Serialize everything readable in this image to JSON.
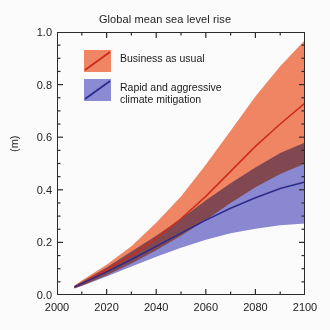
{
  "figure": {
    "title": "Global mean sea level rise",
    "background_color": "#fbfbfb",
    "axis_color": "#2b2b2b"
  },
  "legend": {
    "position": "top-left-inside",
    "entries": [
      {
        "label": "Business as usual",
        "band_color": "#ef8562",
        "line_color": "#cc2b1a",
        "swatch_name": "legend-swatch-business-as-usual"
      },
      {
        "label": "Rapid and aggressive\nclimate mitigation",
        "band_color": "#8b8ad4",
        "line_color": "#2b2b8c",
        "swatch_name": "legend-swatch-climate-mitigation"
      }
    ]
  },
  "chart_data": {
    "type": "area",
    "title": "Global mean sea level rise",
    "xlabel": "",
    "ylabel": "(m)",
    "xlim": [
      2000,
      2100
    ],
    "ylim": [
      0.0,
      1.0
    ],
    "grid": false,
    "legend_position": "upper left",
    "x_major_ticks": [
      2000,
      2020,
      2040,
      2060,
      2080,
      2100
    ],
    "x_tick_labels": [
      "2000",
      "2020",
      "2040",
      "2060",
      "2080",
      "2100"
    ],
    "x_minor_interval": 10,
    "y_major_ticks": [
      0.0,
      0.2,
      0.4,
      0.6,
      0.8,
      1.0
    ],
    "y_tick_labels": [
      "0.0",
      "0.2",
      "0.4",
      "0.6",
      "0.8",
      "1.0"
    ],
    "y_minor_interval": 0.05,
    "x": [
      2007,
      2010,
      2020,
      2030,
      2040,
      2050,
      2060,
      2070,
      2080,
      2090,
      2100
    ],
    "series": [
      {
        "name": "Business as usual",
        "band_color": "#ef8562",
        "line_color": "#cc2b1a",
        "values": [
          0.03,
          0.045,
          0.095,
          0.15,
          0.215,
          0.29,
          0.375,
          0.47,
          0.565,
          0.65,
          0.73
        ],
        "upper": [
          0.035,
          0.055,
          0.115,
          0.185,
          0.275,
          0.375,
          0.495,
          0.625,
          0.755,
          0.87,
          0.97
        ],
        "lower": [
          0.025,
          0.035,
          0.075,
          0.12,
          0.17,
          0.225,
          0.285,
          0.35,
          0.41,
          0.46,
          0.5
        ]
      },
      {
        "name": "Rapid and aggressive climate mitigation",
        "band_color": "#8b8ad4",
        "line_color": "#2b2b8c",
        "values": [
          0.03,
          0.043,
          0.088,
          0.135,
          0.185,
          0.235,
          0.285,
          0.33,
          0.37,
          0.405,
          0.43
        ],
        "upper": [
          0.035,
          0.05,
          0.105,
          0.165,
          0.225,
          0.29,
          0.36,
          0.425,
          0.485,
          0.54,
          0.58
        ],
        "lower": [
          0.025,
          0.034,
          0.07,
          0.108,
          0.145,
          0.18,
          0.21,
          0.235,
          0.252,
          0.265,
          0.272
        ]
      }
    ]
  }
}
